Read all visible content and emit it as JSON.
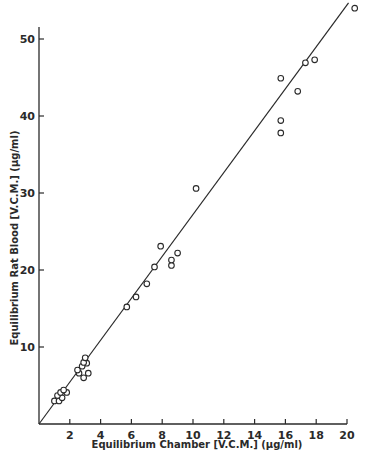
{
  "chart_data": {
    "type": "scatter",
    "title": "",
    "xlabel": "Equilibrium Chamber [V.C.M.] (µg/ml)",
    "ylabel": "Equilibrium Rat Blood [V.C.M.] (µg/ml)",
    "xlim": [
      0,
      20
    ],
    "ylim": [
      0,
      52
    ],
    "x_ticks": [
      2,
      4,
      6,
      8,
      10,
      12,
      14,
      16,
      18,
      20
    ],
    "x_tick_labels": [
      "2",
      "4",
      "6",
      "8",
      "10",
      "12",
      "14",
      "16",
      "18",
      "20"
    ],
    "y_ticks": [
      10,
      20,
      30,
      40,
      50
    ],
    "y_tick_labels": [
      "10",
      "20",
      "30",
      "40",
      "50"
    ],
    "grid": false,
    "legend": null,
    "marker": "open-circle",
    "series": [
      {
        "name": "observations",
        "points": [
          {
            "x": 1.0,
            "y": 3.0
          },
          {
            "x": 1.3,
            "y": 3.0
          },
          {
            "x": 1.5,
            "y": 3.4
          },
          {
            "x": 1.2,
            "y": 3.7
          },
          {
            "x": 1.4,
            "y": 4.1
          },
          {
            "x": 1.8,
            "y": 4.1
          },
          {
            "x": 1.6,
            "y": 4.4
          },
          {
            "x": 2.9,
            "y": 6.0
          },
          {
            "x": 2.6,
            "y": 6.6
          },
          {
            "x": 3.2,
            "y": 6.6
          },
          {
            "x": 2.5,
            "y": 7.0
          },
          {
            "x": 2.8,
            "y": 7.5
          },
          {
            "x": 3.1,
            "y": 7.9
          },
          {
            "x": 2.9,
            "y": 8.0
          },
          {
            "x": 3.0,
            "y": 8.6
          },
          {
            "x": 5.7,
            "y": 15.2
          },
          {
            "x": 6.3,
            "y": 16.5
          },
          {
            "x": 7.0,
            "y": 18.2
          },
          {
            "x": 7.5,
            "y": 20.4
          },
          {
            "x": 8.6,
            "y": 20.6
          },
          {
            "x": 8.6,
            "y": 21.3
          },
          {
            "x": 9.0,
            "y": 22.2
          },
          {
            "x": 7.9,
            "y": 23.1
          },
          {
            "x": 10.2,
            "y": 30.6
          },
          {
            "x": 15.7,
            "y": 37.8
          },
          {
            "x": 15.7,
            "y": 39.4
          },
          {
            "x": 16.8,
            "y": 43.2
          },
          {
            "x": 15.7,
            "y": 44.9
          },
          {
            "x": 17.3,
            "y": 46.9
          },
          {
            "x": 17.9,
            "y": 47.3
          },
          {
            "x": 20.5,
            "y": 54.0
          }
        ]
      },
      {
        "name": "regression line",
        "type": "line",
        "x": [
          0,
          20.1
        ],
        "y": [
          0,
          54.7
        ]
      }
    ]
  }
}
